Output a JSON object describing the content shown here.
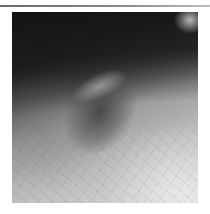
{
  "image": {
    "subject": "grayscale close-up photograph of a raised skin lesion",
    "alt": "Clinical photograph showing an elevated ovoid skin lesion on surrounding skin"
  }
}
